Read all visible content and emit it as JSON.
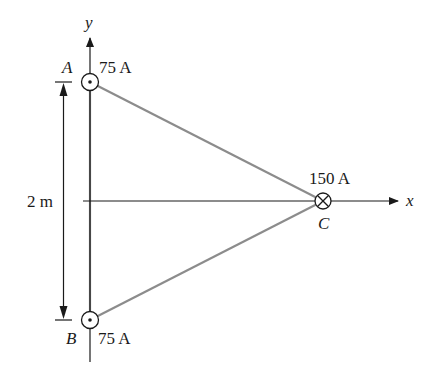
{
  "diagram": {
    "axes": {
      "x_label": "x",
      "y_label": "y"
    },
    "wires": [
      {
        "id": "A",
        "label": "A",
        "current": "75 A",
        "direction": "out-of-page",
        "symbol": "dot-in-circle"
      },
      {
        "id": "B",
        "label": "B",
        "current": "75 A",
        "direction": "out-of-page",
        "symbol": "dot-in-circle"
      },
      {
        "id": "C",
        "label": "C",
        "current": "150 A",
        "direction": "into-page",
        "symbol": "cross-in-circle"
      }
    ],
    "dimension": {
      "label": "2 m",
      "between": [
        "A",
        "B"
      ]
    },
    "colors": {
      "axis": "#1a1a1a",
      "triangle": "#8c8c8c",
      "background": "#ffffff"
    }
  }
}
